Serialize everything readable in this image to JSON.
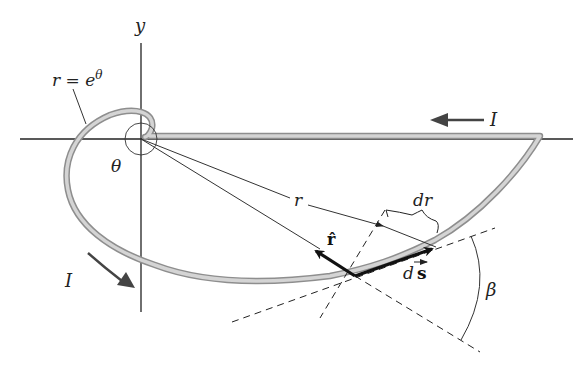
{
  "diagram": {
    "type": "physics-figure",
    "labels": {
      "y_axis": "y",
      "curve_equation": "r = e",
      "curve_equation_exp": "θ",
      "theta": "θ",
      "radius": "r",
      "dr": "dr",
      "r_hat": "r̂",
      "ds_d": "d",
      "ds_s": "s",
      "beta": "β",
      "current_top": "I",
      "current_left": "I"
    },
    "colors": {
      "wire": "#b9b9b9",
      "wire_edge": "#8e8e8e",
      "lines": "#222222",
      "arrows": "#111111",
      "current_arrow": "#444444",
      "background": "#ffffff"
    }
  }
}
